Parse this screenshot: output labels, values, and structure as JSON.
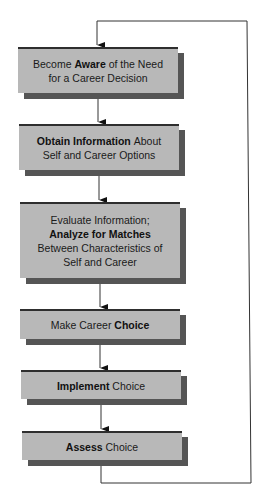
{
  "diagram": {
    "type": "flowchart",
    "colors": {
      "box_fill": "#b8b8b8",
      "box_top_border": "#2e2e2e",
      "shadow": "#555555",
      "line": "#333333"
    },
    "steps": [
      {
        "id": "aware",
        "lines": [
          [
            {
              "t": "Become ",
              "b": false
            },
            {
              "t": "Aware",
              "b": true
            },
            {
              "t": " of the Need",
              "b": false
            }
          ],
          [
            {
              "t": "for a Career Decision",
              "b": false
            }
          ]
        ]
      },
      {
        "id": "obtain",
        "lines": [
          [
            {
              "t": "Obtain Information",
              "b": true
            },
            {
              "t": " About",
              "b": false
            }
          ],
          [
            {
              "t": "Self and Career Options",
              "b": false
            }
          ]
        ]
      },
      {
        "id": "analyze",
        "lines": [
          [
            {
              "t": "Evaluate Information;",
              "b": false
            }
          ],
          [
            {
              "t": "Analyze for Matches",
              "b": true
            }
          ],
          [
            {
              "t": "Between Characteristics of",
              "b": false
            }
          ],
          [
            {
              "t": "Self and Career",
              "b": false
            }
          ]
        ]
      },
      {
        "id": "choice",
        "lines": [
          [
            {
              "t": "Make Career ",
              "b": false
            },
            {
              "t": "Choice",
              "b": true
            }
          ]
        ]
      },
      {
        "id": "implement",
        "lines": [
          [
            {
              "t": "Implement",
              "b": true
            },
            {
              "t": " Choice",
              "b": false
            }
          ]
        ]
      },
      {
        "id": "assess",
        "lines": [
          [
            {
              "t": "Assess",
              "b": true
            },
            {
              "t": " Choice",
              "b": false
            }
          ]
        ]
      }
    ],
    "feedback_loop": {
      "from": "assess",
      "to": "aware"
    }
  }
}
